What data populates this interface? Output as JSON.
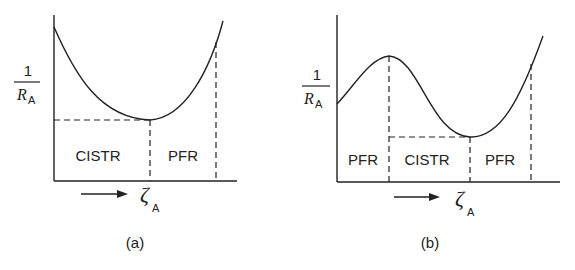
{
  "panels": [
    {
      "id": "a",
      "caption": "(a)",
      "y_label_num": "1",
      "y_label_den": "R",
      "y_label_sub": "A",
      "x_label": "ζ",
      "x_label_sub": "A",
      "regions": [
        "CISTR",
        "PFR"
      ]
    },
    {
      "id": "b",
      "caption": "(b)",
      "y_label_num": "1",
      "y_label_den": "R",
      "y_label_sub": "A",
      "x_label": "ζ",
      "x_label_sub": "A",
      "regions": [
        "PFR",
        "CISTR",
        "PFR"
      ]
    }
  ],
  "colors": {
    "ink": "#222222",
    "background": "#ffffff"
  }
}
